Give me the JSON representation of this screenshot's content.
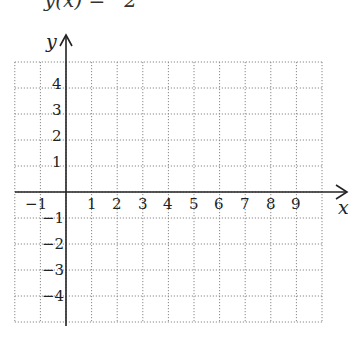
{
  "header": {
    "clipped_text": "y(x) =   2"
  },
  "graph": {
    "x_axis_label": "x",
    "y_axis_label": "y",
    "x_ticks": [
      "−1",
      "1",
      "2",
      "3",
      "4",
      "5",
      "6",
      "7",
      "8",
      "9"
    ],
    "y_ticks_positive": [
      "4",
      "3",
      "2",
      "1"
    ],
    "y_ticks_negative": [
      "−1",
      "−2",
      "−3",
      "−4"
    ],
    "x_range": [
      -2,
      10
    ],
    "y_range": [
      -5,
      5
    ],
    "grid": "dotted",
    "grid_color": "#888888",
    "axis_color": "#222222"
  }
}
